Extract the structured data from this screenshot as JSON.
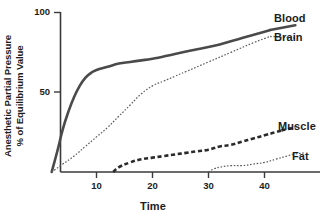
{
  "chart_data": {
    "type": "line",
    "title": "",
    "xlabel": "Time",
    "ylabel": "Anesthetic Partial Pressure % of Equilibrium Value",
    "ylabel_line1": "Anesthetic Partial Pressure",
    "ylabel_line2": "% of Equilibrium Value",
    "xlim": [
      0,
      50
    ],
    "ylim": [
      0,
      100
    ],
    "xticks": [
      10,
      20,
      30,
      40
    ],
    "xtick_labels": [
      "10",
      "20",
      "30",
      "40"
    ],
    "yticks": [
      50,
      100
    ],
    "ytick_labels": [
      "50",
      "100"
    ],
    "grid": false,
    "legend_position": "right-of-curve-ends",
    "series": [
      {
        "name": "Blood",
        "label": "Blood",
        "style": "solid-thick",
        "color": "#4a4a4a",
        "x": [
          2,
          3,
          4,
          5,
          6,
          7,
          8,
          9,
          10,
          12,
          14,
          16,
          18,
          20,
          24,
          28,
          32,
          36,
          40,
          41
        ],
        "y": [
          0,
          13,
          27,
          38,
          47,
          54,
          59,
          62,
          64,
          66,
          68,
          69,
          70,
          71,
          74,
          77,
          80,
          84,
          88,
          89
        ]
      },
      {
        "name": "Brain",
        "label": "Brain",
        "style": "dotted-fine",
        "color": "#5a5a5a",
        "x": [
          2,
          4,
          6,
          8,
          10,
          12,
          14,
          16,
          18,
          20,
          22,
          24,
          26,
          30,
          34,
          38,
          41
        ],
        "y": [
          0,
          5,
          10,
          16,
          22,
          28,
          35,
          42,
          49,
          54,
          57,
          60,
          63,
          69,
          75,
          81,
          85
        ]
      },
      {
        "name": "Muscle",
        "label": "Muscle",
        "style": "dashed-thick",
        "color": "#2b2b2b",
        "x": [
          13,
          14,
          16,
          18,
          20,
          22,
          24,
          26,
          28,
          30,
          32,
          34,
          36,
          38,
          40,
          42,
          43
        ],
        "y": [
          0,
          3,
          6,
          8,
          9,
          10,
          11,
          12,
          13,
          14,
          16,
          17,
          19,
          21,
          23,
          25,
          26
        ]
      },
      {
        "name": "Fat",
        "label": "Fat",
        "style": "dotted-fine",
        "color": "#5a5a5a",
        "x": [
          30,
          31,
          32,
          34,
          36,
          38,
          40,
          42,
          44,
          45
        ],
        "y": [
          0,
          2,
          3,
          4,
          4,
          5,
          6,
          8,
          10,
          11
        ]
      }
    ]
  },
  "axes": {
    "x_title": "Time",
    "y_title_line1": "Anesthetic Partial Pressure",
    "y_title_line2": "% of Equilibrium Value",
    "x_tick_10": "10",
    "x_tick_20": "20",
    "x_tick_30": "30",
    "x_tick_40": "40",
    "y_tick_50": "50",
    "y_tick_100": "100"
  },
  "labels": {
    "blood": "Blood",
    "brain": "Brain",
    "muscle": "Muscle",
    "fat": "Fat"
  },
  "colors": {
    "axis": "#3a3a3a",
    "text": "#1c1c1c",
    "blood": "#4a4a4a",
    "brain": "#5a5a5a",
    "muscle": "#2b2b2b",
    "fat": "#5a5a5a"
  }
}
